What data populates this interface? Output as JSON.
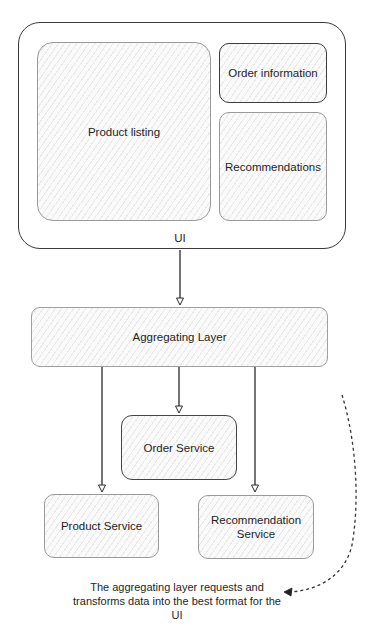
{
  "diagram": {
    "ui_container": {
      "label": "UI",
      "sections": [
        {
          "id": "product-listing",
          "label": "Product listing"
        },
        {
          "id": "order-information",
          "label": "Order information"
        },
        {
          "id": "recommendations",
          "label": "Recommendations"
        }
      ]
    },
    "aggregating_layer": {
      "label": "Aggregating Layer"
    },
    "services": [
      {
        "id": "order-service",
        "label": "Order Service"
      },
      {
        "id": "product-service",
        "label": "Product Service"
      },
      {
        "id": "recommendation-service",
        "label": "Recommendation Service"
      }
    ],
    "edges": [
      {
        "from": "UI",
        "to": "Aggregating Layer",
        "style": "solid"
      },
      {
        "from": "Aggregating Layer",
        "to": "Product Service",
        "style": "solid"
      },
      {
        "from": "Aggregating Layer",
        "to": "Order Service",
        "style": "solid"
      },
      {
        "from": "Aggregating Layer",
        "to": "Recommendation Service",
        "style": "solid"
      },
      {
        "from": "annotation-curve",
        "to": "annotation",
        "style": "dashed"
      }
    ],
    "annotation": {
      "text": "The aggregating layer requests and transforms data into the best format for the UI"
    },
    "colors": {
      "stroke": "#3a3a3a",
      "light_stroke": "#9a9a9a",
      "hatch": "#bebebe",
      "background": "#ffffff"
    }
  }
}
